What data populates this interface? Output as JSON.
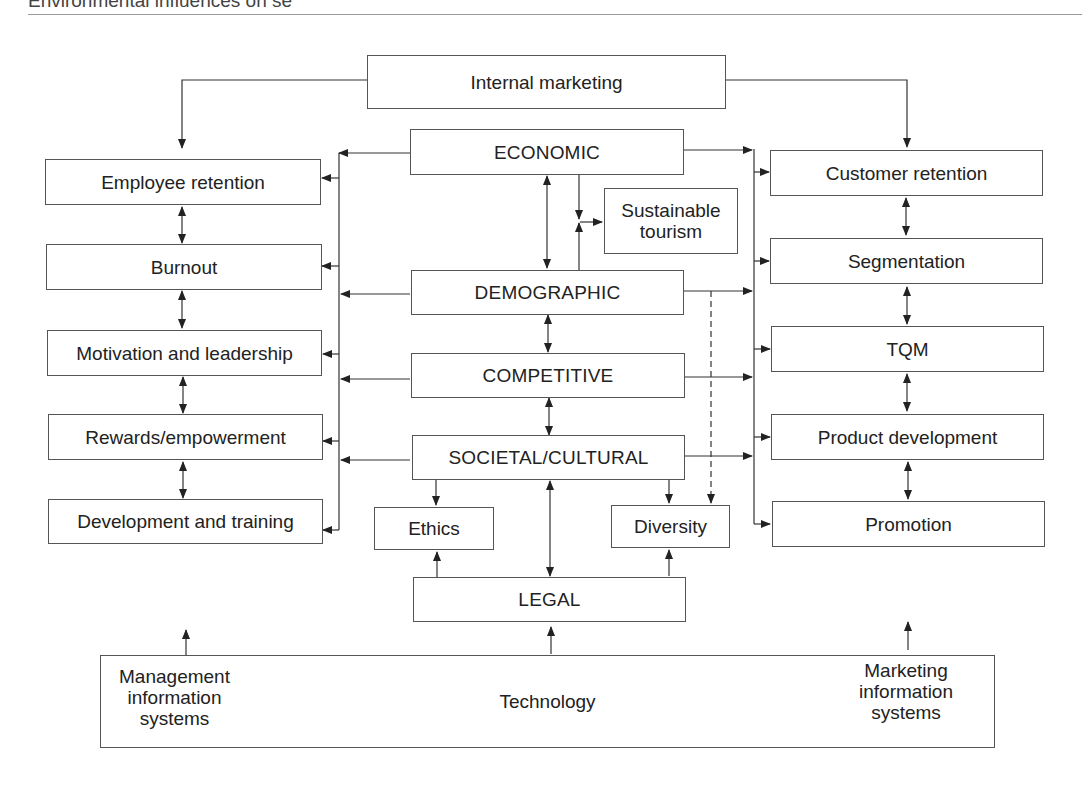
{
  "header": {
    "title": "Environmental influences on se"
  },
  "center": {
    "internal_marketing": "Internal marketing",
    "economic": "ECONOMIC",
    "sustainable_tourism": "Sustainable tourism",
    "demographic": "DEMOGRAPHIC",
    "competitive": "COMPETITIVE",
    "societal_cultural": "SOCIETAL/CULTURAL",
    "ethics": "Ethics",
    "diversity": "Diversity",
    "legal": "LEGAL"
  },
  "left_column": {
    "items": [
      {
        "label": "Employee retention"
      },
      {
        "label": "Burnout"
      },
      {
        "label": "Motivation and leadership"
      },
      {
        "label": "Rewards/empowerment"
      },
      {
        "label": "Development and training"
      }
    ]
  },
  "right_column": {
    "items": [
      {
        "label": "Customer retention"
      },
      {
        "label": "Segmentation"
      },
      {
        "label": "TQM"
      },
      {
        "label": "Product development"
      },
      {
        "label": "Promotion"
      }
    ]
  },
  "technology": {
    "label": "Technology",
    "left_label": "Management information systems",
    "right_label": "Marketing information systems"
  },
  "colors": {
    "line": "#333333",
    "box_border": "#555555",
    "background": "#ffffff"
  }
}
